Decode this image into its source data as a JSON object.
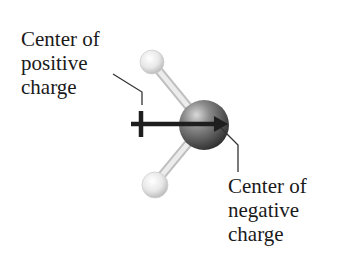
{
  "diagram": {
    "type": "molecular dipole",
    "molecule": "water (H2O) ball-and-stick model",
    "labels": {
      "positive": {
        "lines": [
          "Center of",
          "positive",
          "charge"
        ]
      },
      "negative": {
        "lines": [
          "Center of",
          "negative",
          "charge"
        ]
      }
    },
    "atoms": [
      {
        "name": "hydrogen-top",
        "element": "H",
        "color": "#e6e6e6"
      },
      {
        "name": "hydrogen-bottom",
        "element": "H",
        "color": "#e6e6e6"
      },
      {
        "name": "oxygen",
        "element": "O",
        "color": "#5a5a5a"
      }
    ],
    "arrow": {
      "description": "dipole arrow with crossed tail (+) pointing from positive center to negative center",
      "color": "#1e1e1e"
    },
    "colors": {
      "text": "#1a1a1a",
      "leader_line": "#333333",
      "bond": "#dcdcdc",
      "background": "#ffffff"
    }
  }
}
